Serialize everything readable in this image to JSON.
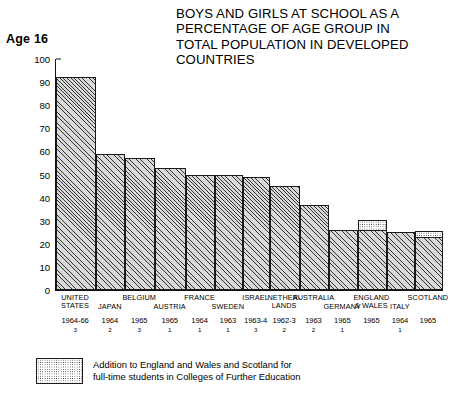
{
  "header": {
    "age_label": "Age 16",
    "title_lines": [
      "BOYS AND GIRLS AT SCHOOL AS A",
      "PERCENTAGE OF AGE GROUP IN",
      "TOTAL POPULATION IN DEVELOPED",
      "COUNTRIES"
    ]
  },
  "legend": {
    "line1": "Addition to England and Wales and Scotland for",
    "line2": "full-time students in Colleges of Further Education"
  },
  "chart_data": {
    "type": "bar",
    "title": "BOYS AND GIRLS AT SCHOOL AS A PERCENTAGE OF AGE GROUP IN TOTAL POPULATION IN DEVELOPED COUNTRIES",
    "subtitle": "Age 16",
    "xlabel": "",
    "ylabel": "",
    "ylim": [
      0,
      100
    ],
    "yticks": [
      0,
      10,
      20,
      30,
      40,
      50,
      60,
      70,
      80,
      90,
      100
    ],
    "grid": false,
    "legend_position": "bottom-left",
    "categories": [
      "UNITED\nSTATES",
      "JAPAN",
      "BELGIUM",
      "AUSTRIA",
      "FRANCE",
      "SWEDEN",
      "ISRAEL",
      "NETHER-\nLANDS",
      "AUSTRALIA",
      "GERMANY",
      "ENGLAND\n& WALES",
      "ITALY",
      "SCOTLAND"
    ],
    "years": [
      "1964-66",
      "1964",
      "1965",
      "1965",
      "1964",
      "1963",
      "1963-4",
      "1962-3",
      "1963",
      "1965",
      "1965",
      "1964",
      "1965"
    ],
    "notes": [
      "3",
      "2",
      "3",
      "1",
      "1",
      "1",
      "3",
      "2",
      "2",
      "1",
      "",
      "1",
      ""
    ],
    "series": [
      {
        "name": "At school as % of age group",
        "values": [
          92,
          59,
          57,
          53,
          50,
          50,
          49,
          45,
          37,
          26,
          26,
          25,
          23
        ]
      },
      {
        "name": "Addition to England and Wales and Scotland for full-time students in Colleges of Further Education",
        "values": [
          0,
          0,
          0,
          0,
          0,
          0,
          0,
          0,
          0,
          0,
          5,
          0,
          3
        ]
      }
    ]
  }
}
